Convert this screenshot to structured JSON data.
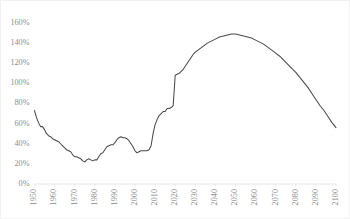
{
  "chart_data": {
    "type": "line",
    "title": "",
    "subtitle": "",
    "xlabel": "",
    "ylabel": "",
    "xlim": [
      1950,
      2100
    ],
    "ylim": [
      0,
      160
    ],
    "grid": false,
    "legend": false,
    "legend_position": "none",
    "line_color": "#4a4a4a",
    "y_tick_labels": [
      "160%",
      "140%",
      "120%",
      "100%",
      "80%",
      "60%",
      "40%",
      "20%",
      "0%"
    ],
    "y_tick_values": [
      160,
      140,
      120,
      100,
      80,
      60,
      40,
      20,
      0
    ],
    "x_tick_labels": [
      "1950",
      "1960",
      "1970",
      "1980",
      "1990",
      "2000",
      "2010",
      "2020",
      "2030",
      "2040",
      "2050",
      "2060",
      "2070",
      "2080",
      "2090",
      "2100"
    ],
    "x_tick_values": [
      1950,
      1960,
      1970,
      1980,
      1990,
      2000,
      2010,
      2020,
      2030,
      2040,
      2050,
      2060,
      2070,
      2080,
      2090,
      2100
    ],
    "series": [
      {
        "name": "Debt to GDP",
        "x": [
          1950,
          1951,
          1952,
          1953,
          1954,
          1955,
          1956,
          1957,
          1958,
          1959,
          1960,
          1961,
          1962,
          1963,
          1964,
          1965,
          1966,
          1967,
          1968,
          1969,
          1970,
          1971,
          1972,
          1973,
          1974,
          1975,
          1976,
          1977,
          1978,
          1979,
          1980,
          1981,
          1982,
          1983,
          1984,
          1985,
          1986,
          1987,
          1988,
          1989,
          1990,
          1991,
          1992,
          1993,
          1994,
          1995,
          1996,
          1997,
          1998,
          1999,
          2000,
          2001,
          2002,
          2003,
          2004,
          2005,
          2006,
          2007,
          2008,
          2009,
          2010,
          2011,
          2012,
          2013,
          2014,
          2015,
          2016,
          2017,
          2018,
          2019,
          2020,
          2021,
          2022,
          2023,
          2024,
          2025,
          2026,
          2027,
          2028,
          2029,
          2030,
          2032,
          2034,
          2036,
          2038,
          2040,
          2042,
          2044,
          2046,
          2048,
          2050,
          2052,
          2054,
          2056,
          2058,
          2060,
          2062,
          2064,
          2066,
          2068,
          2070,
          2072,
          2074,
          2076,
          2078,
          2080,
          2082,
          2084,
          2086,
          2088,
          2090,
          2092,
          2094,
          2096,
          2098,
          2100
        ],
        "values": [
          73,
          66,
          61,
          57,
          57,
          54,
          50,
          48,
          47,
          45,
          44,
          43,
          42,
          40,
          38,
          36,
          34,
          33,
          32,
          29,
          27,
          27,
          26,
          25,
          23,
          22,
          24,
          25,
          24,
          23,
          24,
          24,
          27,
          30,
          31,
          34,
          37,
          38,
          39,
          39,
          41,
          44,
          46,
          47,
          46,
          46,
          45,
          43,
          40,
          37,
          33,
          31,
          32,
          33,
          33,
          33,
          33,
          34,
          38,
          50,
          59,
          64,
          68,
          70,
          72,
          72,
          75,
          75,
          76,
          78,
          108,
          109,
          110,
          112,
          114,
          117,
          120,
          123,
          126,
          129,
          131,
          134,
          137,
          140,
          142,
          144,
          146,
          147,
          148,
          149,
          149,
          148,
          147,
          146,
          145,
          143,
          141,
          139,
          136,
          133,
          130,
          127,
          123,
          119,
          115,
          111,
          106,
          101,
          96,
          90,
          84,
          78,
          73,
          67,
          61,
          56
        ]
      }
    ],
    "annotations": []
  }
}
